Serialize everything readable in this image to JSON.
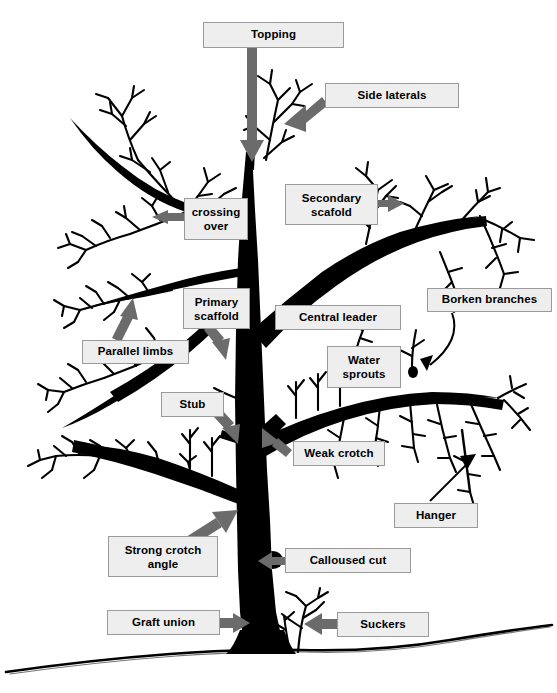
{
  "diagram": {
    "background_color": "#ffffff",
    "tree_color": "#000000",
    "arrow_color": "#6b6b6b",
    "label_fill": "#eeeeee",
    "label_border": "#9a9a9a",
    "ground_color": "#000000"
  },
  "labels": [
    {
      "id": "topping",
      "text": "Topping",
      "x": 203,
      "y": 22,
      "w": 141,
      "h": 26,
      "pointer": "down-arrow-thick",
      "target": "top of central leader"
    },
    {
      "id": "side-laterals",
      "text": "Side laterals",
      "x": 325,
      "y": 83,
      "w": 134,
      "h": 25,
      "pointer": "down-left-arrow-thick",
      "target": "upper right lateral branch"
    },
    {
      "id": "secondary-scafold",
      "text": "Secondary\nscafold",
      "x": 285,
      "y": 184,
      "w": 93,
      "h": 41,
      "pointer": "right-arrow-thick",
      "target": "secondary scaffold limb"
    },
    {
      "id": "crossing-over",
      "text": "crossing\nover",
      "x": 184,
      "y": 198,
      "w": 64,
      "h": 42,
      "pointer": "left-arrow-thick",
      "target": "crossing branches on left"
    },
    {
      "id": "primary-scaffold",
      "text": "Primary\nscaffold",
      "x": 183,
      "y": 288,
      "w": 67,
      "h": 41,
      "pointer": "down-right-arrow-thick",
      "target": "primary scaffold limb"
    },
    {
      "id": "central-leader",
      "text": "Central leader",
      "x": 275,
      "y": 305,
      "w": 126,
      "h": 25,
      "pointer": "none",
      "target": "main vertical trunk"
    },
    {
      "id": "parallel-limbs",
      "text": "Parallel limbs",
      "x": 82,
      "y": 340,
      "w": 107,
      "h": 24,
      "pointer": "up-right-arrow-thick",
      "target": "two parallel limbs on left"
    },
    {
      "id": "borken-branches",
      "text": "Borken branches",
      "x": 427,
      "y": 288,
      "w": 125,
      "h": 24,
      "pointer": "curved-thin-arrow",
      "target": "broken branch stub on right"
    },
    {
      "id": "water-sprouts",
      "text": "Water\nsprouts",
      "x": 327,
      "y": 346,
      "w": 74,
      "h": 42,
      "pointer": "none",
      "target": "vertical shoots on right limb"
    },
    {
      "id": "stub",
      "text": "Stub",
      "x": 161,
      "y": 392,
      "w": 63,
      "h": 25,
      "pointer": "down-right-arrow-thick",
      "target": "stub on trunk"
    },
    {
      "id": "weak-crotch",
      "text": "Weak crotch",
      "x": 293,
      "y": 441,
      "w": 92,
      "h": 25,
      "pointer": "up-left-arrow-thick",
      "target": "narrow branch union"
    },
    {
      "id": "hanger",
      "text": "Hanger",
      "x": 394,
      "y": 503,
      "w": 84,
      "h": 25,
      "pointer": "thin-arrow",
      "target": "downward hanging branch"
    },
    {
      "id": "strong-crotch-angle",
      "text": "Strong crotch\nangle",
      "x": 108,
      "y": 536,
      "w": 110,
      "h": 41,
      "pointer": "up-right-arrow-thick",
      "target": "wide branch union on trunk"
    },
    {
      "id": "calloused-cut",
      "text": "Calloused cut",
      "x": 285,
      "y": 548,
      "w": 126,
      "h": 25,
      "pointer": "left-arrow-thick",
      "target": "healed pruning wound"
    },
    {
      "id": "graft-union",
      "text": "Graft union",
      "x": 107,
      "y": 610,
      "w": 113,
      "h": 25,
      "pointer": "right-arrow-thick",
      "target": "graft union at base of trunk"
    },
    {
      "id": "suckers",
      "text": "Suckers",
      "x": 337,
      "y": 612,
      "w": 92,
      "h": 25,
      "pointer": "left-arrow-thick",
      "target": "shoots from rootstock at ground"
    }
  ],
  "icons": {
    "arrow": "block-arrow-icon",
    "leader_line": "thin-leader-line-icon",
    "tree": "deciduous-tree-silhouette-icon",
    "ground": "ground-line-icon"
  }
}
